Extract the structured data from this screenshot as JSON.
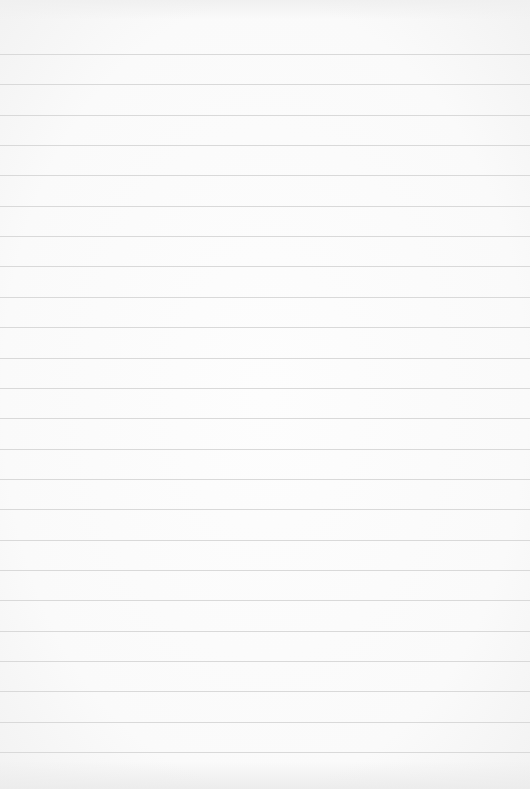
{
  "paper": {
    "background": "#fbfbfb",
    "rule_color": "#d9d9d9",
    "rule_count": 24,
    "first_rule_y": 54,
    "rule_spacing": 30.35
  }
}
